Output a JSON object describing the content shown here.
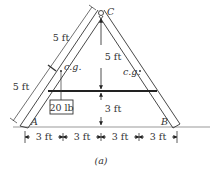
{
  "figure": {
    "caption": "(a)",
    "points": {
      "apex": "C",
      "left_base": "A",
      "right_base": "B"
    },
    "labels": {
      "left_upper_segment": "5 ft",
      "left_lower_segment": "5 ft",
      "height_upper": "5 ft",
      "height_lower": "3 ft",
      "cg_left": "c.g.",
      "cg_right": "c.g.",
      "load": "20 lb"
    },
    "bottom_dimensions": [
      "3 ft",
      "3 ft",
      "3 ft",
      "3 ft"
    ],
    "colors": {
      "stroke": "#333333",
      "ground": "#999999",
      "background": "#ffffff"
    }
  }
}
